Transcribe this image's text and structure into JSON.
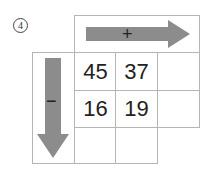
{
  "problem": {
    "number": "4",
    "plus_operator": "+",
    "minus_operator": "−",
    "arrow_color": "#8c8c8c",
    "grid_line_color": "#b5b5b5",
    "cells": [
      [
        "45",
        "37",
        ""
      ],
      [
        "16",
        "19",
        ""
      ],
      [
        "",
        ""
      ]
    ]
  }
}
